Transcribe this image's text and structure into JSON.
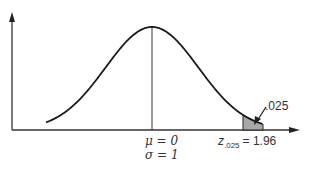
{
  "chart_data": {
    "type": "area",
    "title": "",
    "distribution": "normal",
    "mean": 0,
    "sd": 1,
    "shaded_region": {
      "from": 1.96,
      "to": "inf",
      "area": 0.025
    },
    "labels": {
      "mu": "μ = 0",
      "sigma": "σ = 1",
      "z_main": "z",
      "z_sub": ".025",
      "z_value": "= 1.96",
      "tail_area": ".025"
    },
    "xlabel": "",
    "ylabel": "",
    "grid": false
  },
  "colors": {
    "curve": "#1a1a1a",
    "axis": "#333333",
    "shade": "#a0a0a0"
  }
}
